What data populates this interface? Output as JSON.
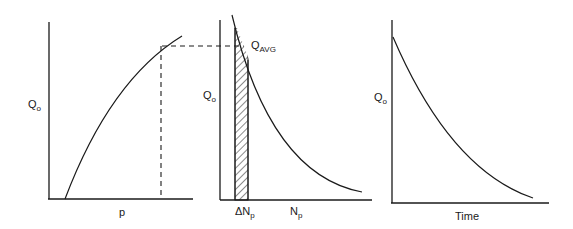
{
  "panels": [
    {
      "id": "qo-vs-p",
      "y_label": "Q",
      "y_label_sub": "o",
      "x_label": "p",
      "curve": "increasing concave"
    },
    {
      "id": "qo-vs-np",
      "y_label": "Q",
      "y_label_sub": "o",
      "x_label": "N",
      "x_label_sub": "p",
      "strip_label": "ΔN",
      "strip_label_sub": "p",
      "annotation": "Q",
      "annotation_sub": "AVG",
      "curve": "decreasing convex"
    },
    {
      "id": "qo-vs-time",
      "y_label": "Q",
      "y_label_sub": "o",
      "x_label": "Time",
      "curve": "decreasing convex"
    }
  ],
  "colors": {
    "ink": "#1a1a1a",
    "background": "#ffffff"
  }
}
